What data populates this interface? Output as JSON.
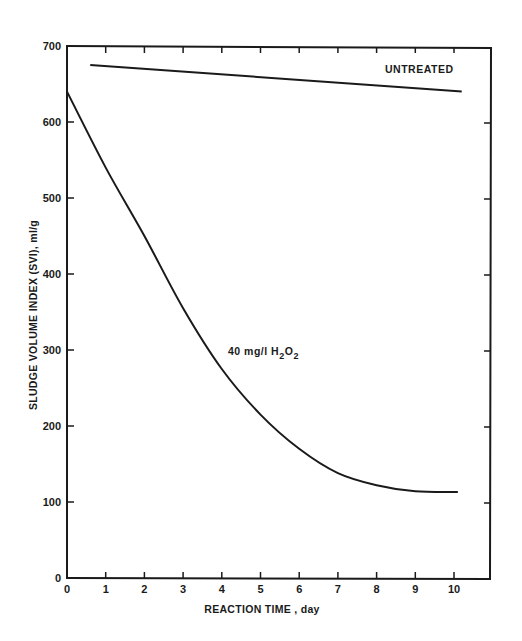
{
  "chart_data": {
    "type": "line",
    "title": "",
    "xlabel": "REACTION TIME , day",
    "ylabel": "SLUDGE VOLUME INDEX (SVI), ml/g",
    "xlim": [
      0,
      11
    ],
    "ylim": [
      0,
      700
    ],
    "x_ticks": [
      0,
      1,
      2,
      3,
      4,
      5,
      6,
      7,
      8,
      9,
      10
    ],
    "y_ticks": [
      0,
      100,
      200,
      300,
      400,
      500,
      600,
      700
    ],
    "grid": false,
    "legend": "none (inline annotations)",
    "series": [
      {
        "name": "UNTREATED",
        "x": [
          0.6,
          10.2
        ],
        "values": [
          675,
          640
        ]
      },
      {
        "name": "40 mg/l H2O2",
        "x": [
          0,
          1,
          2,
          3,
          4,
          5,
          6,
          7,
          8,
          9,
          10.1
        ],
        "values": [
          640,
          540,
          450,
          355,
          275,
          215,
          170,
          138,
          122,
          114,
          113
        ]
      }
    ],
    "annotations": [
      {
        "text": "UNTREATED",
        "x": 8.3,
        "y": 665
      },
      {
        "text": "40 mg/l H2O2",
        "x": 4.3,
        "y": 325
      }
    ]
  },
  "labels": {
    "xlabel": "REACTION TIME , day",
    "ylabel": "SLUDGE VOLUME INDEX (SVI), ml/g",
    "untreated": "UNTREATED",
    "treated_prefix": "40 mg/l H",
    "treated_sub1": "2",
    "treated_mid": "O",
    "treated_sub2": "2"
  }
}
